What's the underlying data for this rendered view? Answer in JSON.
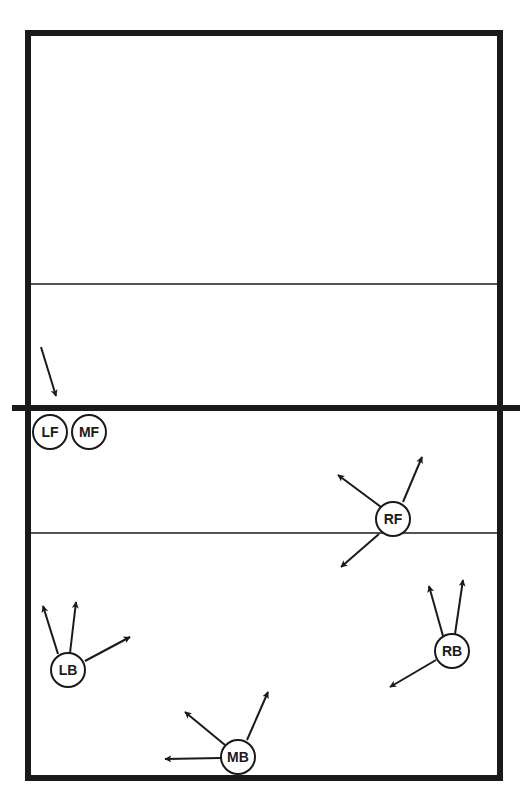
{
  "diagram": {
    "type": "volleyball-court",
    "colors": {
      "line": "#1a1a1a",
      "background": "#ffffff",
      "player_fill": "#ffffff"
    },
    "court": {
      "x1": 28,
      "y1": 33,
      "x2": 500,
      "y2": 778,
      "border_width": 6
    },
    "net": {
      "y": 408,
      "x1": 12,
      "x2": 520,
      "width": 6
    },
    "attack_lines": [
      {
        "y": 284
      },
      {
        "y": 533
      }
    ],
    "players": [
      {
        "id": "LF",
        "label": "LF",
        "cx": 50,
        "cy": 432,
        "r": 17
      },
      {
        "id": "MF",
        "label": "MF",
        "cx": 89,
        "cy": 432,
        "r": 17
      },
      {
        "id": "RF",
        "label": "RF",
        "cx": 393,
        "cy": 519,
        "r": 17
      },
      {
        "id": "LB",
        "label": "LB",
        "cx": 68,
        "cy": 670,
        "r": 17
      },
      {
        "id": "RB",
        "label": "RB",
        "cx": 452,
        "cy": 651,
        "r": 17
      },
      {
        "id": "MB",
        "label": "MB",
        "cx": 238,
        "cy": 757,
        "r": 17
      }
    ],
    "arrows": [
      {
        "player": "LF",
        "x1": 41,
        "y1": 347,
        "x2": 56,
        "y2": 396
      },
      {
        "player": "RF",
        "x1": 381,
        "y1": 507,
        "x2": 338,
        "y2": 475
      },
      {
        "player": "RF",
        "x1": 403,
        "y1": 502,
        "x2": 422,
        "y2": 457
      },
      {
        "player": "RF",
        "x1": 379,
        "y1": 534,
        "x2": 341,
        "y2": 567
      },
      {
        "player": "LB",
        "x1": 58,
        "y1": 654,
        "x2": 43,
        "y2": 606
      },
      {
        "player": "LB",
        "x1": 70,
        "y1": 653,
        "x2": 76,
        "y2": 602
      },
      {
        "player": "LB",
        "x1": 85,
        "y1": 661,
        "x2": 130,
        "y2": 637
      },
      {
        "player": "RB",
        "x1": 443,
        "y1": 636,
        "x2": 429,
        "y2": 586
      },
      {
        "player": "RB",
        "x1": 455,
        "y1": 634,
        "x2": 463,
        "y2": 580
      },
      {
        "player": "RB",
        "x1": 436,
        "y1": 660,
        "x2": 390,
        "y2": 687
      },
      {
        "player": "MB",
        "x1": 225,
        "y1": 745,
        "x2": 185,
        "y2": 712
      },
      {
        "player": "MB",
        "x1": 247,
        "y1": 740,
        "x2": 268,
        "y2": 692
      },
      {
        "player": "MB",
        "x1": 221,
        "y1": 758,
        "x2": 165,
        "y2": 759
      }
    ]
  }
}
